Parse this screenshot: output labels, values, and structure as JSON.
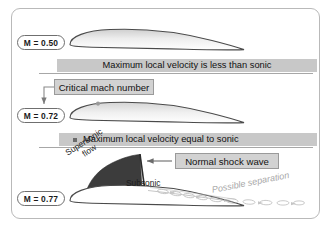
{
  "figure": {
    "border_color": "#b9b9b9",
    "background": "#ffffff"
  },
  "colors": {
    "banner_fill": "#c8c8c8",
    "callout_fill": "#d2d2d2",
    "callout_border": "#9a9a9a",
    "airfoil_outline": "#4a4a4a",
    "supersonic_region": "#3c3c3c",
    "separation_text": "#a8a8a8",
    "rule_line": "#9d9d9d"
  },
  "panels": [
    {
      "id": "panel-subsonic",
      "mach_label": "M = 0.50",
      "banner": "Maximum local velocity is less than sonic",
      "banner_bullet": false
    },
    {
      "id": "panel-critical",
      "mach_label": "M = 0.72",
      "banner": "Maximum local velocity equal to sonic",
      "banner_bullet": true,
      "callout": "Critical mach number"
    },
    {
      "id": "panel-transonic",
      "mach_label": "M = 0.77",
      "callout": "Normal shock wave",
      "labels": {
        "supersonic_line1": "Supersonic",
        "supersonic_line2": "flow",
        "subsonic": "Subsonic",
        "separation": "Possible separation"
      }
    }
  ],
  "mach_labels": {
    "first": "M = 0.50",
    "second": "M = 0.72",
    "third": "M = 0.77"
  },
  "banners": {
    "first": "Maximum local velocity is less than sonic",
    "second": "Maximum local velocity equal to sonic"
  },
  "callouts": {
    "critical": "Critical mach number",
    "shock": "Normal shock wave"
  },
  "flow_labels": {
    "supersonic_line1": "Supersonic",
    "supersonic_line2": "flow",
    "subsonic": "Subsonic",
    "separation": "Possible separation"
  }
}
